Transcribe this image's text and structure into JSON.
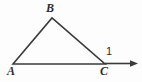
{
  "figure": {
    "kind": "geometry-diagram",
    "width": 142,
    "height": 82,
    "background_color": "#fdfdfd",
    "stroke_color": "#3a3a3a",
    "stroke_width": 1.6,
    "label_color": "#2e2e2e"
  },
  "vertices": {
    "A": {
      "label": "A",
      "x": 13,
      "y": 64,
      "label_x": 7,
      "label_y": 65
    },
    "B": {
      "label": "B",
      "x": 52,
      "y": 18,
      "label_x": 46,
      "label_y": 2
    },
    "C": {
      "label": "C",
      "x": 105,
      "y": 64,
      "label_x": 100,
      "label_y": 65
    }
  },
  "angles": [
    {
      "label": "1",
      "at_vertex": "C",
      "type": "exterior",
      "label_x": 106,
      "label_y": 45
    }
  ],
  "segments": [
    {
      "name": "AB",
      "from": "A",
      "to": "B"
    },
    {
      "name": "BC",
      "from": "B",
      "to": "C"
    },
    {
      "name": "AC",
      "from": "A",
      "to": "C"
    }
  ],
  "ray": {
    "name": "ray-from-C",
    "from_x": 105,
    "from_y": 63.5,
    "to_x": 131,
    "to_y": 63.5,
    "arrowhead_tip_x": 138,
    "arrowhead_tip_y": 63.5,
    "has_arrowhead": true
  },
  "paths": {
    "triangle": "M 13 64 L 52 18 L 105 64 Z",
    "ray_line": "M 105 63.5 L 131 63.5",
    "arrowhead": "M 130 60.2 L 138 63.5 L 130 66.8 Z"
  }
}
